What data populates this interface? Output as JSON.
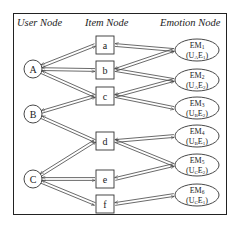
{
  "headers": {
    "user": "User Node",
    "item": "Item Node",
    "emotion": "Emotion Node"
  },
  "users": [
    {
      "id": "A",
      "label": "A",
      "x": 33,
      "y": 69
    },
    {
      "id": "B",
      "label": "B",
      "x": 33,
      "y": 114
    },
    {
      "id": "C",
      "label": "C",
      "x": 33,
      "y": 179
    }
  ],
  "items": [
    {
      "id": "a",
      "label": "a",
      "x": 105,
      "y": 45
    },
    {
      "id": "b",
      "label": "b",
      "x": 105,
      "y": 70
    },
    {
      "id": "c",
      "label": "c",
      "x": 105,
      "y": 96
    },
    {
      "id": "d",
      "label": "d",
      "x": 105,
      "y": 141
    },
    {
      "id": "e",
      "label": "e",
      "x": 105,
      "y": 179
    },
    {
      "id": "f",
      "label": "f",
      "x": 105,
      "y": 204
    }
  ],
  "emotions": [
    {
      "id": "EM1",
      "name": "EM",
      "sub": "1",
      "code": "(UAE1)",
      "code_main": "U",
      "code_u": "A",
      "code_e": "E",
      "code_n": "1",
      "x": 197,
      "y": 50
    },
    {
      "id": "EM2",
      "name": "EM",
      "sub": "2",
      "code": "(UAE2)",
      "code_main": "U",
      "code_u": "A",
      "code_e": "E",
      "code_n": "2",
      "x": 197,
      "y": 80
    },
    {
      "id": "EM3",
      "name": "EM",
      "sub": "3",
      "code": "(UBE2)",
      "code_main": "U",
      "code_u": "B",
      "code_e": "E",
      "code_n": "2",
      "x": 197,
      "y": 108
    },
    {
      "id": "EM4",
      "name": "EM",
      "sub": "4",
      "code": "(UBE1)",
      "code_main": "U",
      "code_u": "B",
      "code_e": "E",
      "code_n": "1",
      "x": 197,
      "y": 136
    },
    {
      "id": "EM5",
      "name": "EM",
      "sub": "5",
      "code": "(UCE2)",
      "code_main": "U",
      "code_u": "C",
      "code_e": "E",
      "code_n": "2",
      "x": 197,
      "y": 165
    },
    {
      "id": "EM6",
      "name": "EM",
      "sub": "6",
      "code": "(UCE1)",
      "code_main": "U",
      "code_u": "C",
      "code_e": "E",
      "code_n": "1",
      "x": 197,
      "y": 195
    }
  ],
  "user_item_edges": [
    [
      "A",
      "a"
    ],
    [
      "A",
      "b"
    ],
    [
      "A",
      "c"
    ],
    [
      "B",
      "c"
    ],
    [
      "B",
      "d"
    ],
    [
      "C",
      "d"
    ],
    [
      "C",
      "e"
    ],
    [
      "C",
      "f"
    ]
  ],
  "item_emotion_edges": [
    [
      "a",
      "EM1"
    ],
    [
      "b",
      "EM1"
    ],
    [
      "b",
      "EM2"
    ],
    [
      "c",
      "EM2"
    ],
    [
      "c",
      "EM3"
    ],
    [
      "d",
      "EM4"
    ],
    [
      "d",
      "EM5"
    ],
    [
      "e",
      "EM5"
    ],
    [
      "f",
      "EM6"
    ]
  ]
}
